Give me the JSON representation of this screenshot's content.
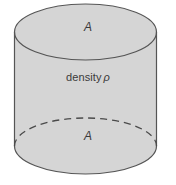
{
  "figure": {
    "kind": "cylinder-diagram",
    "background_color": "#ffffff",
    "labels": {
      "top_area": "A",
      "bottom_area": "A",
      "density_word": "density",
      "density_symbol": "ρ"
    },
    "shape": {
      "fill_color": "#d5d5d5",
      "stroke_color": "#555555",
      "dashed_stroke_color": "#4a4a4a",
      "top_ellipse": {
        "center_x": 85.5,
        "center_y": 32,
        "radius_x": 71,
        "radius_y": 28
      },
      "bottom_ellipse": {
        "center_x": 85.5,
        "center_y": 146,
        "radius_x": 71,
        "radius_y": 28
      },
      "left_wall_x": 14.5,
      "right_wall_x": 156.5,
      "body_top_y": 32,
      "body_bottom_y": 146,
      "dash_pattern": "7,5"
    }
  }
}
